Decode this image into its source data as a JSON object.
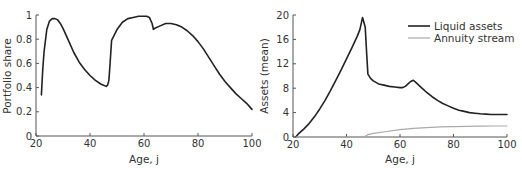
{
  "chart_data": [
    {
      "type": "line",
      "title": "",
      "xlabel": "Age, j",
      "ylabel": "Portfolio share",
      "xlim": [
        20,
        100
      ],
      "ylim": [
        0,
        1
      ],
      "xticks": [
        20,
        40,
        60,
        80,
        100
      ],
      "xtick_labels": [
        "20",
        "40",
        "60",
        "80",
        "100"
      ],
      "yticks": [
        0,
        0.2,
        0.4,
        0.6,
        0.8,
        1
      ],
      "ytick_labels": [
        "0",
        "0.2",
        "0.4",
        "0.6",
        "0.8",
        "1"
      ],
      "grid": false,
      "legend": null,
      "series": [
        {
          "name": "Portfolio share",
          "color": "#222222",
          "x": [
            22,
            22.5,
            23,
            24,
            25,
            26,
            27,
            28,
            29,
            30,
            32,
            34,
            36,
            38,
            40,
            42,
            44,
            45,
            46,
            46.5,
            47,
            47.5,
            48,
            50,
            52,
            54,
            56,
            58,
            60,
            61,
            62,
            63,
            63.5,
            64,
            66,
            68,
            70,
            72,
            74,
            76,
            78,
            80,
            82,
            84,
            86,
            88,
            90,
            92,
            94,
            96,
            98,
            100
          ],
          "y": [
            0.34,
            0.55,
            0.7,
            0.88,
            0.95,
            0.97,
            0.97,
            0.96,
            0.93,
            0.89,
            0.79,
            0.69,
            0.61,
            0.55,
            0.5,
            0.46,
            0.43,
            0.42,
            0.41,
            0.42,
            0.46,
            0.62,
            0.79,
            0.88,
            0.94,
            0.97,
            0.98,
            0.99,
            0.99,
            0.99,
            0.98,
            0.93,
            0.88,
            0.89,
            0.91,
            0.93,
            0.93,
            0.92,
            0.9,
            0.87,
            0.83,
            0.78,
            0.72,
            0.65,
            0.58,
            0.51,
            0.45,
            0.4,
            0.35,
            0.31,
            0.27,
            0.22
          ]
        }
      ]
    },
    {
      "type": "line",
      "title": "",
      "xlabel": "Age, j",
      "ylabel": "Assets (mean)",
      "xlim": [
        20,
        100
      ],
      "ylim": [
        0,
        20
      ],
      "xticks": [
        20,
        40,
        60,
        80,
        100
      ],
      "xtick_labels": [
        "20",
        "40",
        "60",
        "80",
        "100"
      ],
      "yticks": [
        0,
        4,
        8,
        12,
        16,
        20
      ],
      "ytick_labels": [
        "0",
        "4",
        "8",
        "12",
        "16",
        "20"
      ],
      "grid": false,
      "legend": "top-right",
      "series": [
        {
          "name": "Liquid assets",
          "color": "#222222",
          "x": [
            21,
            22,
            24,
            26,
            28,
            30,
            32,
            34,
            36,
            38,
            40,
            42,
            44,
            45,
            46,
            47,
            47.5,
            48,
            49,
            50,
            52,
            54,
            56,
            58,
            60,
            61,
            62,
            63,
            64,
            65,
            66,
            68,
            70,
            72,
            74,
            76,
            78,
            80,
            82,
            84,
            86,
            88,
            90,
            92,
            94,
            96,
            98,
            100
          ],
          "y": [
            0.0,
            0.5,
            1.3,
            2.2,
            3.3,
            4.6,
            6.0,
            7.6,
            9.3,
            11.0,
            12.8,
            14.6,
            16.5,
            17.6,
            19.6,
            18.0,
            14.0,
            10.3,
            9.6,
            9.2,
            8.7,
            8.5,
            8.3,
            8.2,
            8.1,
            8.1,
            8.3,
            8.7,
            9.1,
            9.3,
            8.9,
            8.1,
            7.3,
            6.6,
            6.0,
            5.5,
            5.1,
            4.7,
            4.4,
            4.2,
            4.0,
            3.9,
            3.8,
            3.75,
            3.7,
            3.7,
            3.7,
            3.7
          ]
        },
        {
          "name": "Annuity stream",
          "color": "#aaaaaa",
          "x": [
            21,
            30,
            40,
            46,
            47,
            48,
            50,
            55,
            60,
            65,
            70,
            75,
            80,
            85,
            90,
            95,
            100
          ],
          "y": [
            0,
            0,
            0,
            0,
            0.1,
            0.4,
            0.6,
            0.9,
            1.2,
            1.4,
            1.55,
            1.65,
            1.7,
            1.75,
            1.78,
            1.8,
            1.8
          ]
        }
      ]
    }
  ]
}
